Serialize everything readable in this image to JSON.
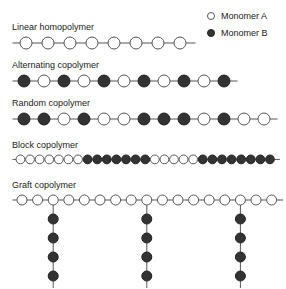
{
  "legend": {
    "items": [
      {
        "symbol": "open-circle",
        "label": "Monomer A",
        "type": "A"
      },
      {
        "symbol": "filled-circle",
        "label": "Monomer B",
        "type": "B"
      }
    ]
  },
  "colors": {
    "monomer_a_fill": "#ffffff",
    "monomer_a_stroke": "#555555",
    "monomer_b_fill": "#333333",
    "monomer_b_stroke": "#222222",
    "bond": "#555555",
    "text": "#1a1a1a",
    "background": "#ffffff"
  },
  "chart_data": {
    "type": "diagram",
    "title": "",
    "rows": [
      {
        "label": "Linear homopolymer",
        "top": 22,
        "left": 12,
        "node_spacing": 22,
        "node_radius": 6,
        "lead_in": 8,
        "lead_out": 8,
        "sequence": [
          "A",
          "A",
          "A",
          "A",
          "A",
          "A",
          "A",
          "A"
        ],
        "branches": []
      },
      {
        "label": "Alternating copolymer",
        "top": 60,
        "left": 12,
        "node_spacing": 20,
        "node_radius": 6,
        "lead_in": 6,
        "lead_out": 6,
        "sequence": [
          "B",
          "A",
          "B",
          "A",
          "B",
          "A",
          "B",
          "A",
          "B",
          "A",
          "B"
        ],
        "branches": []
      },
      {
        "label": "Random copolymer",
        "top": 98,
        "left": 12,
        "node_spacing": 20,
        "node_radius": 6,
        "lead_in": 6,
        "lead_out": 6,
        "sequence": [
          "B",
          "B",
          "A",
          "B",
          "A",
          "A",
          "B",
          "B",
          "B",
          "A",
          "B",
          "A",
          "A"
        ],
        "branches": []
      },
      {
        "label": "Block copolymer",
        "top": 140,
        "left": 12,
        "node_spacing": 9.6,
        "node_radius": 4.4,
        "lead_in": 4,
        "lead_out": 4,
        "sequence": [
          "A",
          "A",
          "A",
          "A",
          "A",
          "A",
          "A",
          "B",
          "B",
          "B",
          "B",
          "B",
          "B",
          "B",
          "A",
          "A",
          "A",
          "A",
          "A",
          "B",
          "B",
          "B",
          "B",
          "B",
          "B",
          "B",
          "B"
        ],
        "branches": []
      },
      {
        "label": "Graft copolymer",
        "top": 180,
        "left": 12,
        "node_spacing": 15.6,
        "node_radius": 5,
        "lead_in": 5,
        "lead_out": 5,
        "sequence": [
          "A",
          "A",
          "A",
          "A",
          "A",
          "A",
          "A",
          "A",
          "A",
          "A",
          "A",
          "A",
          "A",
          "A",
          "A",
          "A",
          "A"
        ],
        "branches": [
          {
            "backbone_index": 2,
            "sequence": [
              "B",
              "B",
              "B",
              "B"
            ],
            "tail": true
          },
          {
            "backbone_index": 8,
            "sequence": [
              "B",
              "B",
              "B",
              "B"
            ],
            "tail": true
          },
          {
            "backbone_index": 14,
            "sequence": [
              "B",
              "B",
              "B",
              "B"
            ],
            "tail": true
          }
        ],
        "branch_spacing": 19,
        "branch_node_radius": 5
      }
    ]
  }
}
